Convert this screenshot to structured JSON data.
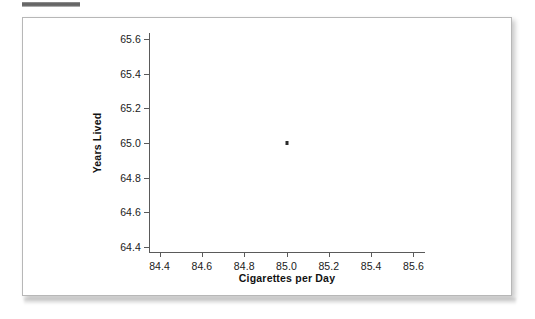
{
  "figure": {
    "background_color": "#ffffff",
    "frame_color": "#b7b7b7",
    "axis_color": "#5a5a5a",
    "marker_color": "#2b2b2b"
  },
  "chart_data": {
    "type": "scatter",
    "title": "",
    "xlabel": "Cigarettes per Day",
    "ylabel": "Years Lived",
    "xlim": [
      84.35,
      85.65
    ],
    "ylim": [
      64.37,
      65.63
    ],
    "xticks": [
      "84.4",
      "84.6",
      "84.8",
      "85.0",
      "85.2",
      "85.4",
      "85.6"
    ],
    "xtick_values": [
      84.4,
      84.6,
      84.8,
      85.0,
      85.2,
      85.4,
      85.6
    ],
    "yticks": [
      "65.6",
      "65.4",
      "65.2",
      "65.0",
      "64.8",
      "64.6",
      "64.4"
    ],
    "ytick_values": [
      65.6,
      65.4,
      65.2,
      65.0,
      64.8,
      64.6,
      64.4
    ],
    "grid": false,
    "legend": null,
    "series": [
      {
        "name": "observation",
        "marker": "square",
        "points": [
          {
            "x": 85.0,
            "y": 65.0
          }
        ]
      }
    ]
  }
}
